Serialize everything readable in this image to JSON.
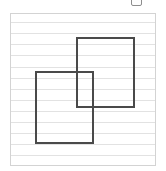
{
  "canvas": {
    "width": 166,
    "height": 171,
    "background": "#ffffff"
  },
  "top_mark": {
    "label": "",
    "border_color": "#8d8d8d"
  },
  "panel": {
    "x": 10,
    "y": 13,
    "width": 146,
    "height": 153,
    "border_color": "#d3d3d3",
    "background": "#ffffff",
    "rule_color": "#e2e2e2",
    "rule_spacing": 11.2,
    "rule_count": 13,
    "rule_offsets": [
      8,
      19,
      30,
      41,
      53,
      64,
      75,
      86,
      97,
      108,
      119,
      130,
      141
    ]
  },
  "shapes": [
    {
      "name": "upper-right-rectangle",
      "x": 65,
      "y": 23,
      "width": 59,
      "height": 71,
      "stroke": "#4a4a4a",
      "stroke_width": 2,
      "fill": "none"
    },
    {
      "name": "lower-left-rectangle",
      "x": 24,
      "y": 57,
      "width": 59,
      "height": 73,
      "stroke": "#4a4a4a",
      "stroke_width": 2,
      "fill": "none"
    }
  ]
}
